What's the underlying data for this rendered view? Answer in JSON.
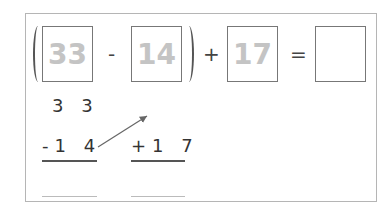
{
  "equation": {
    "box1": "33",
    "op1": "-",
    "box2": "14",
    "op2": "+",
    "box3": "17",
    "equals": "=",
    "result": ""
  },
  "work": {
    "col1_top": "3 3",
    "col1_sub": "-1 4",
    "col2_add": "+1 7"
  }
}
